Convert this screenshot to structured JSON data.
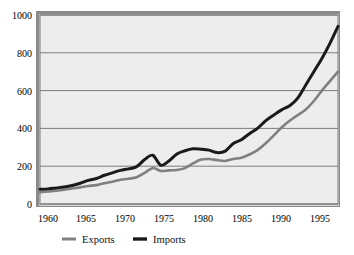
{
  "chart_data": {
    "type": "line",
    "title": "",
    "subtitle": "",
    "xlabel": "",
    "ylabel": "",
    "xlim": [
      1960,
      1997
    ],
    "ylim": [
      0,
      1000
    ],
    "grid": true,
    "legend_position": "bottom",
    "x_ticks": [
      "1960",
      "1965",
      "1970",
      "1975",
      "1980",
      "1985",
      "1990",
      "1995"
    ],
    "x_tick_values": [
      1960,
      1965,
      1970,
      1975,
      1980,
      1985,
      1990,
      1995
    ],
    "y_ticks": [
      "0",
      "200",
      "400",
      "600",
      "800",
      "1000"
    ],
    "y_tick_values": [
      0,
      200,
      400,
      600,
      800,
      1000
    ],
    "x": [
      1960,
      1961,
      1962,
      1963,
      1964,
      1965,
      1966,
      1967,
      1968,
      1969,
      1970,
      1971,
      1972,
      1973,
      1974,
      1975,
      1976,
      1977,
      1978,
      1979,
      1980,
      1981,
      1982,
      1983,
      1984,
      1985,
      1986,
      1987,
      1988,
      1989,
      1990,
      1991,
      1992,
      1993,
      1994,
      1995,
      1996,
      1997
    ],
    "series": [
      {
        "name": "Exports",
        "color": "#808080",
        "values": [
          62,
          66,
          70,
          75,
          82,
          88,
          95,
          100,
          110,
          118,
          128,
          134,
          142,
          165,
          190,
          175,
          178,
          180,
          190,
          215,
          235,
          238,
          232,
          228,
          238,
          245,
          262,
          285,
          320,
          362,
          405,
          440,
          470,
          500,
          545,
          600,
          650,
          700
        ]
      },
      {
        "name": "Imports",
        "color": "#1a1a1a",
        "values": [
          78,
          80,
          85,
          90,
          98,
          110,
          125,
          135,
          152,
          165,
          178,
          186,
          198,
          235,
          258,
          205,
          228,
          265,
          282,
          292,
          290,
          285,
          272,
          280,
          320,
          340,
          372,
          400,
          440,
          470,
          498,
          520,
          560,
          630,
          700,
          770,
          850,
          940
        ]
      }
    ],
    "annotations": []
  },
  "legend": {
    "items": [
      {
        "label": "Exports",
        "color": "#808080"
      },
      {
        "label": "Imports",
        "color": "#1a1a1a"
      }
    ]
  }
}
